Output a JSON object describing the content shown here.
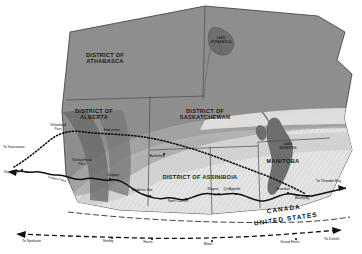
{
  "map": {
    "title": "Canadian Prairie Districts and Railways",
    "colors": {
      "land_dark": "#8e8e8e",
      "land_mid": "#a8a8a8",
      "land_light": "#cfcfcf",
      "land_pale": "#e4e4e4",
      "water": "#6e6e6e",
      "outline": "#3a3a3a",
      "rail_line": "#111111",
      "background": "#ffffff"
    },
    "districts": [
      {
        "name": "district-athabasca",
        "line1": "DISTRICT OF",
        "line2": "ATHABASCA",
        "x": 105,
        "y": 57
      },
      {
        "name": "district-alberta",
        "line1": "DISTRICT OF",
        "line2": "ALBERTA",
        "x": 94,
        "y": 113
      },
      {
        "name": "district-saskatchewan",
        "line1": "DISTRICT OF",
        "line2": "SASKATCHEWAN",
        "x": 205,
        "y": 113
      },
      {
        "name": "district-assiniboia",
        "line1": "DISTRICT OF ASSINIBOIA",
        "line2": "",
        "x": 200,
        "y": 179
      }
    ],
    "provinces": [
      {
        "name": "province-manitoba",
        "label": "MANITOBA",
        "x": 283,
        "y": 163
      }
    ],
    "water_labels": [
      {
        "name": "lake-athabasca",
        "line1": "LAKE",
        "line2": "ATHABASCA",
        "x": 221,
        "y": 39
      },
      {
        "name": "lake-winnipeg",
        "line1": "LAKE",
        "line2": "WINNIPEG",
        "x": 288,
        "y": 145
      }
    ],
    "cities": [
      {
        "name": "city-edmonton",
        "label": "Edmonton",
        "x": 112,
        "y": 131,
        "dot_x": 109,
        "dot_y": 134
      },
      {
        "name": "city-calgary",
        "label": "Calgary",
        "x": 113,
        "y": 176,
        "dot_x": 110,
        "dot_y": 179
      },
      {
        "name": "city-kamloops",
        "label": "Kamloops",
        "x": 12,
        "y": 173,
        "dot_x": 22,
        "dot_y": 170
      },
      {
        "name": "city-medicine-hat",
        "label": "Medicine Hat",
        "x": 142,
        "y": 191,
        "dot_x": 150,
        "dot_y": 196
      },
      {
        "name": "city-swift-current",
        "label": "Swift Current",
        "x": 178,
        "y": 202,
        "dot_x": 186,
        "dot_y": 199
      },
      {
        "name": "city-regina",
        "label": "Regina",
        "x": 213,
        "y": 190,
        "dot_x": 219,
        "dot_y": 194
      },
      {
        "name": "city-quappelle",
        "label": "Qu'Appelle",
        "x": 232,
        "y": 190,
        "dot_x": 236,
        "dot_y": 194
      },
      {
        "name": "city-winnipeg",
        "label": "Winnipeg",
        "x": 302,
        "y": 199,
        "dot_x": 307,
        "dot_y": 196
      },
      {
        "name": "city-battleford",
        "label": "Battleford",
        "x": 157,
        "y": 157,
        "dot_x": 164,
        "dot_y": 154
      },
      {
        "name": "city-brandon",
        "label": "Brandon",
        "x": 283,
        "y": 190,
        "dot_x": 288,
        "dot_y": 193
      },
      {
        "name": "city-shelby",
        "label": "Shelby",
        "x": 108,
        "y": 242,
        "dot_x": 112,
        "dot_y": 238
      },
      {
        "name": "city-havre",
        "label": "Havre",
        "x": 148,
        "y": 243,
        "dot_x": 152,
        "dot_y": 239
      },
      {
        "name": "city-minot",
        "label": "Minot",
        "x": 208,
        "y": 245,
        "dot_x": 212,
        "dot_y": 241
      },
      {
        "name": "city-grand-forks",
        "label": "Grand Forks",
        "x": 290,
        "y": 243,
        "dot_x": 296,
        "dot_y": 239
      }
    ],
    "passes": [
      {
        "name": "pass-yellowhead",
        "line1": "Yellowhead",
        "line2": "Pass",
        "x": 58,
        "y": 126
      },
      {
        "name": "pass-kicking-horse",
        "line1": "Kicking Horse",
        "line2": "Pass",
        "x": 82,
        "y": 161
      }
    ],
    "destinations": [
      {
        "name": "destination-vancouver",
        "label": "To Vancouver",
        "x": 3,
        "y": 148
      },
      {
        "name": "destination-thunder-bay",
        "label": "To Thunder Bay",
        "x": 316,
        "y": 182
      },
      {
        "name": "destination-spokane",
        "label": "To Spokane",
        "x": 22,
        "y": 242
      },
      {
        "name": "destination-duluth",
        "label": "To Duluth",
        "x": 324,
        "y": 240
      }
    ],
    "rail_labels": [
      {
        "name": "rail-rogers-pass",
        "label": "Rogers Pass",
        "x": 48,
        "y": 178
      }
    ],
    "border": {
      "canada_label": "CANADA",
      "united_states_label": "UNITED STATES",
      "canada_x": 284,
      "canada_y": 211,
      "us_x": 286,
      "us_y": 221
    }
  }
}
